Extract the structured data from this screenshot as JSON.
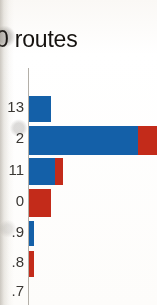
{
  "figure": {
    "title": "0 routes",
    "title_note_visible_only": "left-cropped heading text as rendered"
  },
  "chart_data": {
    "type": "bar",
    "orientation": "horizontal",
    "stacked": true,
    "title": "0 routes",
    "xlabel": "",
    "ylabel": "",
    "grid": false,
    "legend": "none",
    "categories": [
      "13",
      "2",
      "11",
      "0",
      ".9",
      ".8",
      ".7"
    ],
    "series": [
      {
        "name": "blue-series",
        "color": "#1460a8",
        "values": [
          22,
          109,
          26,
          0,
          5,
          0,
          0
        ]
      },
      {
        "name": "red-series",
        "color": "#c32b1a",
        "values": [
          0,
          17,
          8,
          22,
          0,
          5,
          0
        ]
      }
    ],
    "xlim": [
      0,
      128
    ],
    "value_units": "pixel-length as printed (axis not labeled in crop)"
  },
  "axis": {
    "tick_labels": [
      {
        "text": "13",
        "top": 99
      },
      {
        "text": "2",
        "top": 130
      },
      {
        "text": "11",
        "top": 162
      },
      {
        "text": "0",
        "top": 193
      },
      {
        "text": ".9",
        "top": 224
      },
      {
        "text": ".8",
        "top": 254
      },
      {
        "text": ".7",
        "top": 283
      }
    ]
  },
  "bars": [
    {
      "label": "13",
      "top": 96,
      "height": 26,
      "segments": [
        {
          "color": "#1460a8",
          "width": 22
        }
      ]
    },
    {
      "label": "2",
      "top": 126,
      "height": 29,
      "segments": [
        {
          "color": "#1460a8",
          "width": 109
        },
        {
          "color": "#c32b1a",
          "width": 19
        }
      ]
    },
    {
      "label": "11",
      "top": 158,
      "height": 27,
      "segments": [
        {
          "color": "#1460a8",
          "width": 26
        },
        {
          "color": "#c32b1a",
          "width": 8
        }
      ]
    },
    {
      "label": "0",
      "top": 189,
      "height": 28,
      "segments": [
        {
          "color": "#c32b1a",
          "width": 22
        }
      ]
    },
    {
      "label": ".9",
      "top": 221,
      "height": 25,
      "segments": [
        {
          "color": "#1460a8",
          "width": 5
        }
      ]
    },
    {
      "label": ".8",
      "top": 251,
      "height": 26,
      "segments": [
        {
          "color": "#c32b1a",
          "width": 5
        }
      ]
    }
  ],
  "colors": {
    "blue": "#1460a8",
    "red": "#c32b1a",
    "axis": "#b3afa8",
    "text": "#15120f",
    "paper": "#fbfaf8"
  }
}
